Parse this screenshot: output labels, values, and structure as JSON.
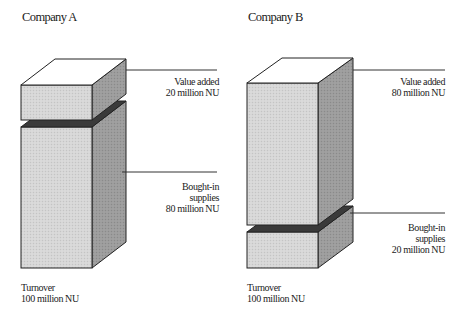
{
  "company_a": {
    "title": "Company A",
    "value_added": {
      "line1": "Value added",
      "line2": "20 million NU",
      "value": 20
    },
    "bought_in": {
      "line1": "Bought-in",
      "line2": "supplies",
      "line3": "80 million NU",
      "value": 80
    },
    "turnover": {
      "line1": "Turnover",
      "line2": "100 million NU",
      "value": 100
    }
  },
  "company_b": {
    "title": "Company B",
    "value_added": {
      "line1": "Value added",
      "line2": "80 million NU",
      "value": 80
    },
    "bought_in": {
      "line1": "Bought-in",
      "line2": "supplies",
      "line3": "20 million NU",
      "value": 20
    },
    "turnover": {
      "line1": "Turnover",
      "line2": "100 million NU",
      "value": 100
    }
  },
  "colors": {
    "front_face": "#d9d9d9",
    "side_face": "#9a9a9a",
    "top_face": "#ffffff",
    "separator": "#3a3a3a",
    "outline": "#222222"
  }
}
